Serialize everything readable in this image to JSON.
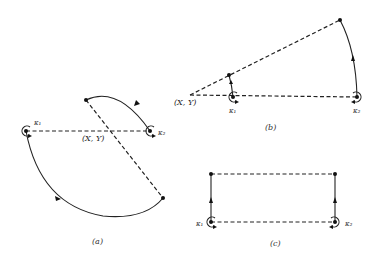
{
  "figure": {
    "panels": [
      {
        "id": "a",
        "caption": "(a)",
        "point_label": "(X, Y)",
        "vortex_1_label": "κ₁",
        "vortex_2_label": "κ₂"
      },
      {
        "id": "b",
        "caption": "(b)",
        "point_label": "(X, Y)",
        "vortex_1_label": "κ₁",
        "vortex_2_label": "κ₂"
      },
      {
        "id": "c",
        "caption": "(c)",
        "vortex_1_label": "κ₁",
        "vortex_2_label": "κ₂"
      }
    ],
    "colors": {
      "ink": "#222222",
      "background": "#ffffff"
    }
  }
}
